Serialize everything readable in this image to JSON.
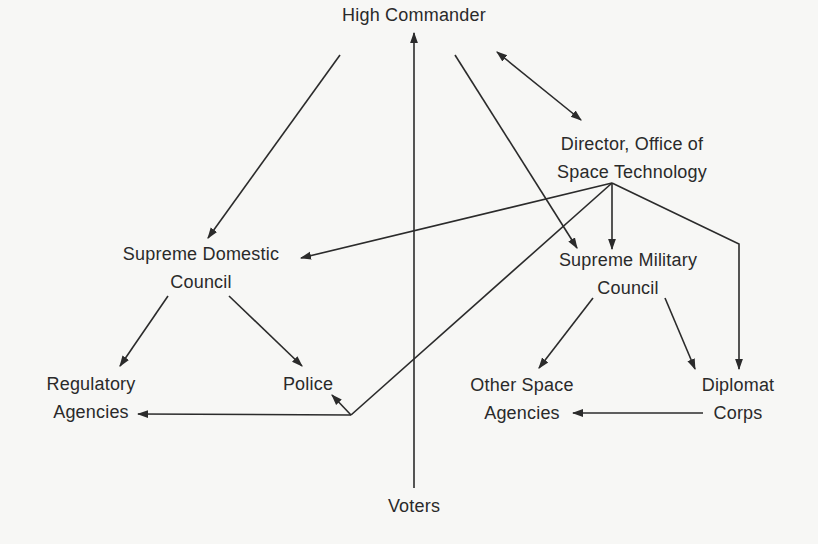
{
  "diagram": {
    "type": "organizational-chart",
    "nodes": {
      "high_commander": {
        "lines": [
          "High Commander"
        ]
      },
      "director": {
        "lines": [
          "Director, Office of",
          "Space Technology"
        ]
      },
      "supreme_domestic": {
        "lines": [
          "Supreme Domestic",
          "Council"
        ]
      },
      "supreme_military": {
        "lines": [
          "Supreme Military",
          "Council"
        ]
      },
      "regulatory": {
        "lines": [
          "Regulatory",
          "Agencies"
        ]
      },
      "police": {
        "lines": [
          "Police"
        ]
      },
      "other_space": {
        "lines": [
          "Other Space",
          "Agencies"
        ]
      },
      "diplomat": {
        "lines": [
          "Diplomat",
          "Corps"
        ]
      },
      "voters": {
        "lines": [
          "Voters"
        ]
      }
    },
    "edges": [
      {
        "from": "High Commander",
        "to": "Supreme Domestic Council",
        "direction": "forward"
      },
      {
        "from": "High Commander",
        "to": "Supreme Military Council",
        "direction": "forward"
      },
      {
        "from": "High Commander",
        "to": "Director, Office of Space Technology",
        "direction": "both"
      },
      {
        "from": "Voters",
        "to": "High Commander",
        "direction": "forward"
      },
      {
        "from": "Director, Office of Space Technology",
        "to": "Supreme Domestic Council",
        "direction": "forward"
      },
      {
        "from": "Director, Office of Space Technology",
        "to": "Supreme Military Council",
        "direction": "forward"
      },
      {
        "from": "Director, Office of Space Technology",
        "to": "Diplomat Corps",
        "direction": "forward"
      },
      {
        "from": "Director, Office of Space Technology",
        "to": "Police",
        "direction": "forward"
      },
      {
        "from": "Director, Office of Space Technology",
        "to": "Regulatory Agencies",
        "direction": "forward"
      },
      {
        "from": "Supreme Domestic Council",
        "to": "Regulatory Agencies",
        "direction": "forward"
      },
      {
        "from": "Supreme Domestic Council",
        "to": "Police",
        "direction": "forward"
      },
      {
        "from": "Supreme Military Council",
        "to": "Other Space Agencies",
        "direction": "forward"
      },
      {
        "from": "Supreme Military Council",
        "to": "Diplomat Corps",
        "direction": "forward"
      },
      {
        "from": "Diplomat Corps",
        "to": "Other Space Agencies",
        "direction": "forward"
      }
    ],
    "colors": {
      "ink": "#2b2b2b",
      "paper": "#f7f7f5"
    }
  }
}
